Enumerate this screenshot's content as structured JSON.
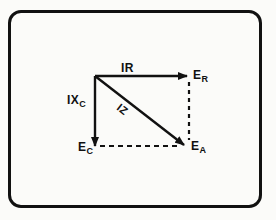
{
  "diagram": {
    "type": "phasor-diagram",
    "colors": {
      "line": "#111111",
      "background": "#fbfbf9"
    },
    "vectors": [
      {
        "id": "IR",
        "label": "IR",
        "style": "solid-arrow",
        "from": "origin",
        "to": "E_R"
      },
      {
        "id": "IXC",
        "label_main": "IX",
        "label_sub": "C",
        "style": "solid-arrow",
        "from": "origin",
        "to": "E_C"
      },
      {
        "id": "IZ",
        "label": "IZ",
        "style": "solid-arrow",
        "from": "origin",
        "to": "E_A"
      }
    ],
    "projections": [
      {
        "from": "E_R",
        "to": "E_A",
        "style": "dashed"
      },
      {
        "from": "E_C",
        "to": "E_A",
        "style": "dashed"
      }
    ],
    "points": {
      "E_R": {
        "main": "E",
        "sub": "R"
      },
      "E_C": {
        "main": "E",
        "sub": "C"
      },
      "E_A": {
        "main": "E",
        "sub": "A"
      }
    }
  }
}
